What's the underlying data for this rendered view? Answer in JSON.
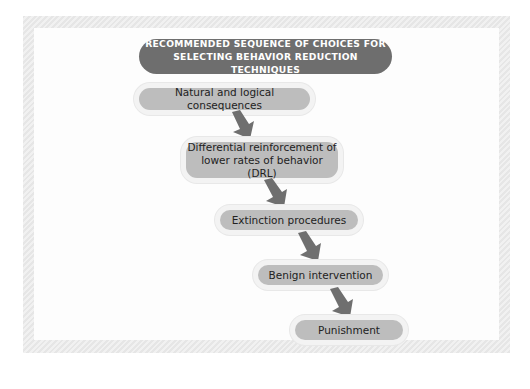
{
  "title": {
    "line1": "RECOMMENDED SEQUENCE OF CHOICES FOR",
    "line2": "SELECTING BEHAVIOR REDUCTION TECHNIQUES"
  },
  "steps": [
    {
      "label": "Natural and logical consequences"
    },
    {
      "label_line1": "Differential reinforcement of",
      "label_line2": "lower rates of behavior (DRL)"
    },
    {
      "label": "Extinction procedures"
    },
    {
      "label": "Benign intervention"
    },
    {
      "label": "Punishment"
    }
  ],
  "colors": {
    "title_fill": "#6e6e6e",
    "step_fill": "#bdbdbd",
    "arrow_fill": "#6f6f6f",
    "frame_border": "#e6e6e6"
  },
  "icons": {
    "connector": "down-right-arrow"
  }
}
